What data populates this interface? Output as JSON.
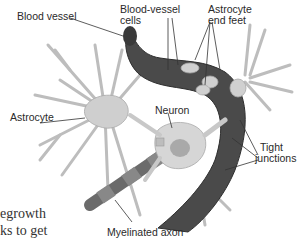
{
  "diagram": {
    "labels": {
      "blood_vessel": "Blood vessel",
      "blood_vessel_cells_1": "Blood-vessel",
      "blood_vessel_cells_2": "cells",
      "astrocyte_end_feet_1": "Astrocyte",
      "astrocyte_end_feet_2": "end feet",
      "astrocyte": "Astrocyte",
      "neuron": "Neuron",
      "tight_junctions_1": "Tight",
      "tight_junctions_2": "junctions",
      "myelinated_axon": "Myelinated axon"
    },
    "body_text": {
      "line1": "egrowth",
      "line2": "ks to get"
    },
    "colors": {
      "vessel": "#4a4a4a",
      "vessel_dark": "#2e2e2e",
      "cell": "#c8c8c8",
      "cell_light": "#dcdcdc",
      "leader": "#333333"
    }
  }
}
